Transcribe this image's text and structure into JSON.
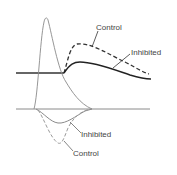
{
  "diagram": {
    "upper_trace": {
      "labels": {
        "control": "Control",
        "inhibited": "Inhibited"
      },
      "colors": {
        "baseline": "#333333",
        "inhibited": "#222222",
        "control": "#333333"
      }
    },
    "spike": {
      "color": "#8a8a8a"
    },
    "lower_trace": {
      "labels": {
        "inhibited": "Inhibited",
        "control": "Control"
      },
      "colors": {
        "baseline": "#8a8a8a",
        "inhibited": "#8a8a8a",
        "control": "#999999"
      }
    }
  }
}
